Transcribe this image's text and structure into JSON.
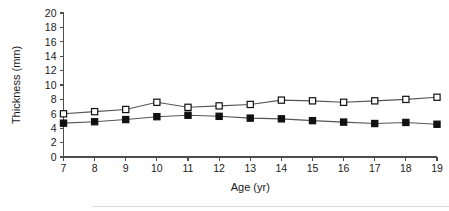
{
  "chart_data": {
    "type": "line",
    "title": "",
    "xlabel": "Age (yr)",
    "ylabel": "Thickness (mm)",
    "x": [
      7,
      8,
      9,
      10,
      11,
      12,
      13,
      14,
      15,
      16,
      17,
      18,
      19
    ],
    "xtick_labels": [
      "7",
      "8",
      "9",
      "10",
      "11",
      "12",
      "13",
      "14",
      "15",
      "16",
      "17",
      "18",
      "19"
    ],
    "ytick_labels": [
      "0",
      "2",
      "4",
      "6",
      "8",
      "10",
      "12",
      "14",
      "16",
      "18",
      "20"
    ],
    "yticks": [
      0,
      2,
      4,
      6,
      8,
      10,
      12,
      14,
      16,
      18,
      20
    ],
    "xlim": [
      7,
      19
    ],
    "ylim": [
      0,
      20
    ],
    "grid": false,
    "legend": "none",
    "series": [
      {
        "name": "open-square-series",
        "marker": "open-square",
        "values": [
          6.0,
          6.3,
          6.6,
          7.6,
          6.9,
          7.1,
          7.3,
          7.9,
          7.8,
          7.6,
          7.8,
          8.0,
          8.3
        ]
      },
      {
        "name": "filled-square-series",
        "marker": "filled-square",
        "values": [
          4.7,
          4.9,
          5.2,
          5.6,
          5.8,
          5.65,
          5.4,
          5.3,
          5.05,
          4.85,
          4.65,
          4.8,
          4.55
        ]
      }
    ],
    "colors": {
      "axis": "#4d4d4d",
      "line": "#555555",
      "marker_open_fill": "#ffffff",
      "marker_filled_fill": "#111111",
      "marker_stroke": "#111111",
      "text": "#1a1a1a"
    }
  }
}
